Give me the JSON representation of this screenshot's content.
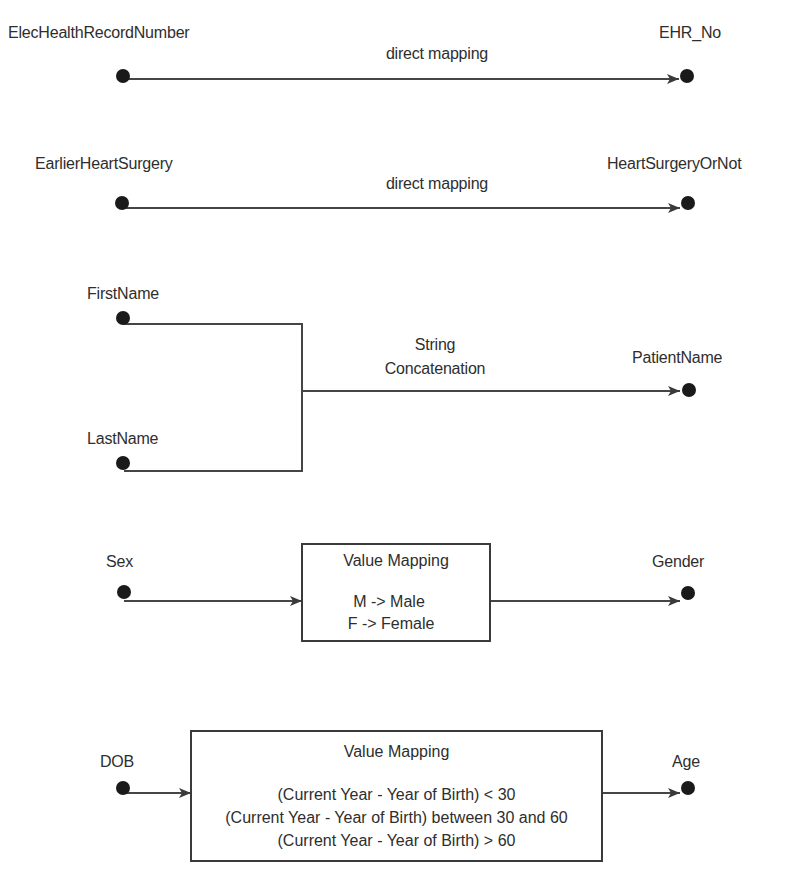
{
  "diagram": {
    "title": "",
    "colors": {
      "text": "#2e2e2e",
      "line": "#404040",
      "node": "#1a1a1a"
    },
    "mappings": [
      {
        "source": "ElecHealthRecordNumber",
        "target": "EHR_No",
        "transform": "direct mapping"
      },
      {
        "source": "EarlierHeartSurgery",
        "target": "HeartSurgeryOrNot",
        "transform": "direct mapping"
      },
      {
        "sources": [
          "FirstName",
          "LastName"
        ],
        "target": "PatientName",
        "transform_lines": [
          "String",
          "Concatenation"
        ]
      },
      {
        "source": "Sex",
        "target": "Gender",
        "box_title": "Value Mapping",
        "rules": [
          "M -> Male",
          "F -> Female"
        ]
      },
      {
        "source": "DOB",
        "target": "Age",
        "box_title": "Value Mapping",
        "rules": [
          "(Current Year - Year of Birth) < 30",
          "(Current Year - Year of Birth) between 30 and 60",
          "(Current Year - Year of Birth) > 60"
        ]
      }
    ]
  }
}
